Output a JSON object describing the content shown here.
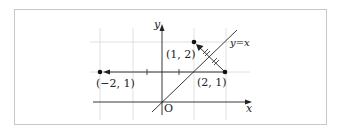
{
  "diagram": {
    "axes": {
      "x_label": "x",
      "y_label": "y",
      "origin_label": "O"
    },
    "line_label": "y=x",
    "points": [
      {
        "name": "P",
        "label": "(1, 2)",
        "x": 1,
        "y": 2
      },
      {
        "name": "Q",
        "label": "(2, 1)",
        "x": 2,
        "y": 1
      },
      {
        "name": "R",
        "label": "(−2, 1)",
        "x": -2,
        "y": 1
      }
    ],
    "arrows": [
      {
        "from": "(2, 1)",
        "to": "(1, 2)",
        "note": "reflection across y=x, equal halves marked with double ticks"
      },
      {
        "from": "(2, 1)",
        "to": "(−2, 1)",
        "note": "horizontal move along y=1"
      }
    ],
    "grid": {
      "x_range": [
        -2,
        2
      ],
      "y_range": [
        0,
        2
      ]
    },
    "colors": {
      "line": "#222222",
      "grid": "#d8d8d8",
      "frame": "#c8c8c8"
    }
  }
}
